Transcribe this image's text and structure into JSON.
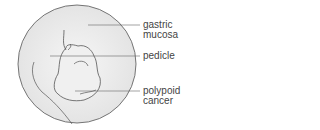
{
  "diagram": {
    "labels": [
      {
        "id": "gastric-mucosa",
        "line1": "gastric",
        "line2": "mucosa"
      },
      {
        "id": "pedicle",
        "line1": "pedicle"
      },
      {
        "id": "polypoid-cancer",
        "line1": "polypoid",
        "line2": "cancer"
      }
    ]
  }
}
